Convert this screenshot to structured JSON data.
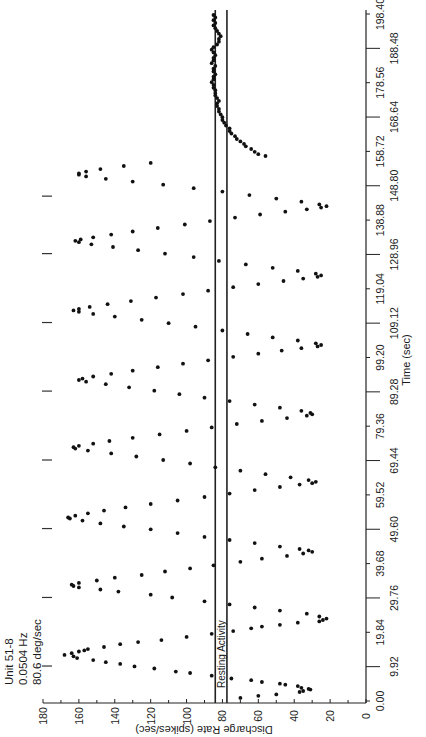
{
  "chart_data": {
    "type": "scatter",
    "orientation": "rotated-90-ccw",
    "title": "",
    "annotation_lines": [
      "Unit 51-8",
      "0.0504 Hz",
      "80.6 deg/sec"
    ],
    "xlabel": "Time (sec)",
    "ylabel": "Discharge Rate (spikes/sec)",
    "xlim": [
      0,
      198.4
    ],
    "ylim": [
      0,
      180
    ],
    "x_ticks": [
      "0.00",
      "9.92",
      "19.84",
      "29.76",
      "39.68",
      "49.60",
      "59.52",
      "69.44",
      "79.36",
      "89.28",
      "99.20",
      "109.12",
      "119.04",
      "128.96",
      "138.88",
      "148.80",
      "158.72",
      "168.64",
      "178.56",
      "188.48",
      "198.40"
    ],
    "y_ticks": [
      "0",
      "20",
      "40",
      "60",
      "80",
      "100",
      "120",
      "140",
      "160",
      "180"
    ],
    "grid": false,
    "legend": null,
    "reference_lines": [
      {
        "name": "resting-activity-upper",
        "value": 84
      },
      {
        "name": "resting-activity-lower",
        "value": 77.5
      }
    ],
    "reference_label": "Resting Activity",
    "stimulus_marker_times": [
      10.1,
      29.9,
      49.8,
      69.6,
      89.5,
      109.3,
      129.2,
      145.8
    ],
    "series": [
      {
        "name": "Discharge rate",
        "stimulus": {
          "frequency_hz": 0.0504,
          "period_sec": 19.84,
          "mean": 91,
          "amplitude": 71,
          "first_peak_sec": 13.3,
          "end_sec": 155.5
        },
        "points": [
          [
            0.9,
            70
          ],
          [
            1.5,
            60
          ],
          [
            1.9,
            50
          ],
          [
            2.6,
            37
          ],
          [
            2.9,
            35
          ],
          [
            3.3,
            31
          ],
          [
            3.5,
            32
          ],
          [
            3.8,
            36
          ],
          [
            4.3,
            38
          ],
          [
            4.7,
            45
          ],
          [
            5.0,
            48
          ],
          [
            5.5,
            58
          ],
          [
            6.0,
            64
          ],
          [
            6.5,
            75
          ],
          [
            7.3,
            86
          ],
          [
            8.1,
            98
          ],
          [
            8.5,
            106
          ],
          [
            9.4,
            118
          ],
          [
            10.0,
            129
          ],
          [
            10.7,
            137
          ],
          [
            11.2,
            145
          ],
          [
            11.8,
            152
          ],
          [
            12.4,
            161
          ],
          [
            12.9,
            163
          ],
          [
            13.3,
            168
          ],
          [
            13.8,
            164
          ],
          [
            14.3,
            160
          ],
          [
            14.6,
            157
          ],
          [
            15.0,
            155
          ],
          [
            15.6,
            146
          ],
          [
            16.4,
            137
          ],
          [
            17.0,
            127
          ],
          [
            17.6,
            114
          ],
          [
            18.5,
            100
          ],
          [
            19.4,
            86
          ],
          [
            20.2,
            74
          ],
          [
            21.0,
            64
          ],
          [
            21.5,
            58
          ],
          [
            22.0,
            48
          ],
          [
            22.6,
            38
          ],
          [
            23.0,
            26
          ],
          [
            23.4,
            24
          ],
          [
            23.8,
            22
          ],
          [
            24.4,
            26
          ],
          [
            25.2,
            33
          ],
          [
            26.1,
            48
          ],
          [
            27.0,
            62
          ],
          [
            27.9,
            76
          ],
          [
            28.8,
            90
          ],
          [
            29.9,
            108
          ],
          [
            30.7,
            120
          ],
          [
            31.6,
            138
          ],
          [
            32.2,
            148
          ],
          [
            32.8,
            160
          ],
          [
            33.2,
            163
          ],
          [
            33.6,
            164
          ],
          [
            34.1,
            160
          ],
          [
            34.8,
            150
          ],
          [
            35.6,
            140
          ],
          [
            36.4,
            125
          ],
          [
            37.4,
            112
          ],
          [
            38.3,
            98
          ],
          [
            39.2,
            85
          ],
          [
            40.2,
            70
          ],
          [
            41.1,
            58
          ],
          [
            41.9,
            44
          ],
          [
            42.6,
            35
          ],
          [
            43.1,
            30
          ],
          [
            43.5,
            32
          ],
          [
            43.9,
            37
          ],
          [
            44.6,
            48
          ],
          [
            45.6,
            62
          ],
          [
            46.5,
            76
          ],
          [
            47.4,
            90
          ],
          [
            48.5,
            105
          ],
          [
            49.6,
            120
          ],
          [
            50.4,
            135
          ],
          [
            51.3,
            148
          ],
          [
            52.1,
            158
          ],
          [
            52.7,
            165
          ],
          [
            53.0,
            166
          ],
          [
            53.5,
            162
          ],
          [
            54.2,
            155
          ],
          [
            55.0,
            146
          ],
          [
            55.9,
            134
          ],
          [
            56.9,
            120
          ],
          [
            57.9,
            105
          ],
          [
            58.9,
            90
          ],
          [
            59.9,
            76
          ],
          [
            60.9,
            62
          ],
          [
            61.8,
            48
          ],
          [
            62.5,
            37
          ],
          [
            62.9,
            30
          ],
          [
            63.3,
            28
          ],
          [
            63.8,
            32
          ],
          [
            64.6,
            42
          ],
          [
            65.5,
            56
          ],
          [
            66.5,
            70
          ],
          [
            67.5,
            84
          ],
          [
            68.6,
            98
          ],
          [
            69.6,
            113
          ],
          [
            70.6,
            128
          ],
          [
            71.5,
            142
          ],
          [
            72.3,
            155
          ],
          [
            72.9,
            162
          ],
          [
            73.3,
            163
          ],
          [
            73.7,
            160
          ],
          [
            74.3,
            152
          ],
          [
            75.1,
            143
          ],
          [
            76.0,
            130
          ],
          [
            77.0,
            115
          ],
          [
            78.0,
            100
          ],
          [
            79.0,
            86
          ],
          [
            80.0,
            72
          ],
          [
            80.9,
            58
          ],
          [
            81.7,
            44
          ],
          [
            82.4,
            33
          ],
          [
            82.8,
            30
          ],
          [
            83.2,
            31
          ],
          [
            83.8,
            36
          ],
          [
            84.7,
            48
          ],
          [
            85.6,
            62
          ],
          [
            86.6,
            76
          ],
          [
            87.6,
            90
          ],
          [
            88.6,
            104
          ],
          [
            89.6,
            118
          ],
          [
            90.6,
            132
          ],
          [
            91.5,
            145
          ],
          [
            92.2,
            156
          ],
          [
            92.7,
            160
          ],
          [
            93.1,
            158
          ],
          [
            93.7,
            152
          ],
          [
            94.5,
            142
          ],
          [
            95.4,
            130
          ],
          [
            96.4,
            116
          ],
          [
            97.4,
            102
          ],
          [
            98.4,
            88
          ],
          [
            99.4,
            74
          ],
          [
            100.3,
            60
          ],
          [
            101.2,
            47
          ],
          [
            101.9,
            36
          ],
          [
            102.4,
            27
          ],
          [
            102.8,
            25
          ],
          [
            103.3,
            28
          ],
          [
            104.1,
            38
          ],
          [
            105.0,
            52
          ],
          [
            106.0,
            66
          ],
          [
            107.0,
            80
          ],
          [
            108.1,
            95
          ],
          [
            109.1,
            110
          ],
          [
            110.1,
            125
          ],
          [
            111.0,
            140
          ],
          [
            111.8,
            152
          ],
          [
            112.4,
            160
          ],
          [
            112.8,
            163
          ],
          [
            113.2,
            160
          ],
          [
            113.8,
            154
          ],
          [
            114.6,
            144
          ],
          [
            115.5,
            131
          ],
          [
            116.5,
            117
          ],
          [
            117.5,
            102
          ],
          [
            118.5,
            88
          ],
          [
            119.5,
            74
          ],
          [
            120.4,
            60
          ],
          [
            121.3,
            46
          ],
          [
            122.0,
            35
          ],
          [
            122.5,
            27
          ],
          [
            122.9,
            25
          ],
          [
            123.4,
            28
          ],
          [
            124.2,
            38
          ],
          [
            125.1,
            52
          ],
          [
            126.1,
            67
          ],
          [
            127.1,
            82
          ],
          [
            128.2,
            96
          ],
          [
            129.2,
            112
          ],
          [
            130.2,
            127
          ],
          [
            131.1,
            141
          ],
          [
            131.9,
            153
          ],
          [
            132.5,
            160
          ],
          [
            132.9,
            162
          ],
          [
            133.3,
            159
          ],
          [
            133.9,
            152
          ],
          [
            134.7,
            142
          ],
          [
            135.6,
            130
          ],
          [
            136.6,
            116
          ],
          [
            137.6,
            101
          ],
          [
            138.6,
            87
          ],
          [
            139.6,
            73
          ],
          [
            140.5,
            59
          ],
          [
            141.3,
            45
          ],
          [
            142.0,
            33
          ],
          [
            142.5,
            25
          ],
          [
            142.9,
            22
          ],
          [
            143.4,
            26
          ],
          [
            144.2,
            36
          ],
          [
            145.1,
            50
          ],
          [
            146.1,
            65
          ],
          [
            147.1,
            80
          ],
          [
            148.1,
            96
          ],
          [
            149.1,
            113
          ],
          [
            150.0,
            130
          ],
          [
            150.8,
            145
          ],
          [
            151.5,
            156
          ],
          [
            152.0,
            160
          ],
          [
            152.4,
            160
          ],
          [
            152.9,
            156
          ],
          [
            153.6,
            148
          ],
          [
            154.5,
            135
          ],
          [
            155.4,
            120
          ],
          [
            157.4,
            56
          ],
          [
            157.9,
            60
          ],
          [
            158.6,
            62
          ],
          [
            159.4,
            64
          ],
          [
            160.2,
            67
          ],
          [
            160.9,
            68
          ],
          [
            161.6,
            70
          ],
          [
            162.3,
            72
          ],
          [
            163.1,
            73
          ],
          [
            163.9,
            75
          ],
          [
            164.6,
            76
          ],
          [
            165.4,
            76
          ],
          [
            166.2,
            78
          ],
          [
            167.0,
            79
          ],
          [
            167.8,
            80
          ],
          [
            168.6,
            80
          ],
          [
            169.4,
            81
          ],
          [
            170.2,
            82
          ],
          [
            171.0,
            82
          ],
          [
            171.8,
            83
          ],
          [
            172.6,
            83
          ],
          [
            173.3,
            82
          ],
          [
            174.1,
            83
          ],
          [
            174.9,
            84
          ],
          [
            175.6,
            84
          ],
          [
            176.4,
            84
          ],
          [
            177.1,
            85
          ],
          [
            177.9,
            85
          ],
          [
            178.7,
            86
          ],
          [
            179.5,
            85
          ],
          [
            180.3,
            85
          ],
          [
            181.0,
            84
          ],
          [
            181.8,
            85
          ],
          [
            182.6,
            85
          ],
          [
            183.4,
            84
          ],
          [
            184.2,
            86
          ],
          [
            185.0,
            85
          ],
          [
            185.7,
            85
          ],
          [
            186.5,
            84
          ],
          [
            187.3,
            85
          ],
          [
            188.1,
            86
          ],
          [
            188.8,
            85
          ],
          [
            189.6,
            83
          ],
          [
            190.4,
            82
          ],
          [
            191.2,
            82
          ],
          [
            192.0,
            81
          ],
          [
            192.7,
            82
          ],
          [
            193.5,
            83
          ],
          [
            194.3,
            84
          ],
          [
            195.1,
            85
          ],
          [
            195.8,
            84
          ],
          [
            196.6,
            85
          ],
          [
            197.4,
            84
          ],
          [
            198.1,
            85
          ]
        ]
      }
    ]
  },
  "info_box": {
    "line1": "Unit 51-8",
    "line2": "0.0504 Hz",
    "line3": "80.6 deg/sec"
  },
  "axes": {
    "time_label": "Time (sec)",
    "rate_label": "Discharge Rate (spikes/sec)",
    "resting_label": "Resting Activity"
  }
}
